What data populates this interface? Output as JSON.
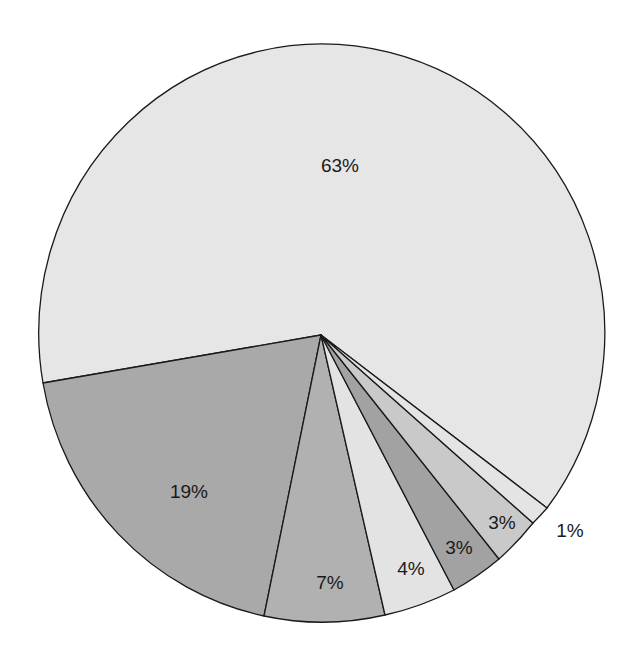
{
  "chart_data": {
    "type": "pie",
    "title": "",
    "start_angle_note": "slices drawn clockwise starting from the left (63% ends at left-lower edge)",
    "slices": [
      {
        "label": "63%",
        "value": 63,
        "color": "#e6e6e6",
        "label_pos": [
          340,
          165
        ]
      },
      {
        "label": "19%",
        "value": 19,
        "color": "#a9a9a9",
        "label_pos": [
          189,
          491
        ]
      },
      {
        "label": "7%",
        "value": 7,
        "color": "#b1b1b1",
        "label_pos": [
          330,
          582
        ]
      },
      {
        "label": "4%",
        "value": 4,
        "color": "#e3e3e3",
        "label_pos": [
          411,
          568
        ]
      },
      {
        "label": "3%",
        "value": 3,
        "color": "#a2a2a2",
        "label_pos": [
          459,
          547
        ]
      },
      {
        "label": "3%",
        "value": 3,
        "color": "#c9c9c9",
        "label_pos": [
          502,
          522
        ]
      },
      {
        "label": "1%",
        "value": 1,
        "color": "#e4e4e4",
        "label_pos": [
          570,
          530
        ],
        "label_outside": true
      }
    ],
    "legend": null,
    "geometry": {
      "center": [
        321,
        335
      ],
      "rx": 283,
      "ry": 289,
      "boundary_points": [
        [
          43,
          383
        ],
        [
          264,
          616
        ],
        [
          385,
          615
        ],
        [
          454,
          590
        ],
        [
          499,
          559
        ],
        [
          533,
          523
        ],
        [
          547,
          508
        ]
      ]
    }
  }
}
